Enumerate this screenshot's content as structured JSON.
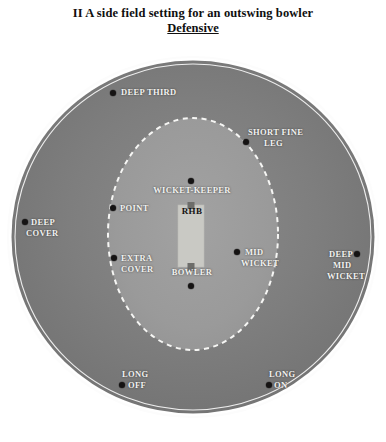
{
  "title": {
    "line1": "II A side field setting for an outswing bowler",
    "line2": "Defensive"
  },
  "colors": {
    "outfield": "#7c7c7c",
    "infield": "#9a9a9a",
    "boundary_line": "#fbfbfb",
    "inner_circle_line": "#f4f4f2",
    "pitch": "#c9c9c4",
    "dot": "#151313",
    "label_light": "#f2f2f0",
    "label_dark": "#141313",
    "background": "#ffffff"
  },
  "pitch": {
    "batsman_label": "RHB",
    "bowler_label": "BOWLER",
    "keeper_label": "WICKET-KEEPER"
  },
  "fielders": [
    {
      "name": "deep-third",
      "label": "DEEP THIRD",
      "lines": [
        "DEEP THIRD"
      ]
    },
    {
      "name": "short-fine-leg",
      "label": "SHORT FINE LEG",
      "lines": [
        "SHORT FINE",
        "LEG"
      ]
    },
    {
      "name": "point",
      "label": "POINT",
      "lines": [
        "POINT"
      ]
    },
    {
      "name": "deep-cover",
      "label": "DEEP COVER",
      "lines": [
        "DEEP",
        "COVER"
      ]
    },
    {
      "name": "extra-cover",
      "label": "EXTRA COVER",
      "lines": [
        "EXTRA",
        "COVER"
      ]
    },
    {
      "name": "mid-wicket",
      "label": "MID WICKET",
      "lines": [
        "MID",
        "WICKET"
      ]
    },
    {
      "name": "deep-mid-wicket",
      "label": "DEEP MID WICKET",
      "lines": [
        "DEEP",
        "MID",
        "WICKET"
      ]
    },
    {
      "name": "long-off",
      "label": "LONG OFF",
      "lines": [
        "LONG",
        "OFF"
      ]
    },
    {
      "name": "long-on",
      "label": "LONG ON",
      "lines": [
        "LONG",
        "ON"
      ]
    },
    {
      "name": "wicket-keeper",
      "label": "WICKET-KEEPER",
      "lines": [
        "WICKET-KEEPER"
      ]
    },
    {
      "name": "bowler",
      "label": "BOWLER",
      "lines": [
        "BOWLER"
      ]
    }
  ],
  "labels": {
    "deep_third": "DEEP THIRD",
    "short_fine_leg_1": "SHORT FINE",
    "short_fine_leg_2": "LEG",
    "point": "POINT",
    "deep_cover_1": "DEEP",
    "deep_cover_2": "COVER",
    "extra_cover_1": "EXTRA",
    "extra_cover_2": "COVER",
    "mid_wicket_1": "MID",
    "mid_wicket_2": "WICKET",
    "deep_mid_wicket_1": "DEEP",
    "deep_mid_wicket_2": "MID",
    "deep_mid_wicket_3": "WICKET",
    "long_off_1": "LONG",
    "long_off_2": "OFF",
    "long_on_1": "LONG",
    "long_on_2": "ON",
    "wicket_keeper": "WICKET-KEEPER",
    "bowler": "BOWLER",
    "rhb": "RHB"
  }
}
